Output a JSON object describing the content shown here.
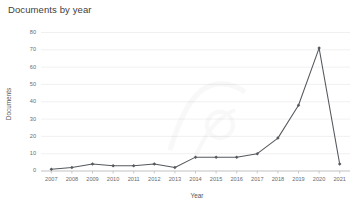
{
  "chart_data": {
    "type": "line",
    "title": "Documents by year",
    "xlabel": "Year",
    "ylabel": "Documents",
    "categories": [
      "2007",
      "2008",
      "2009",
      "2010",
      "2011",
      "2012",
      "2013",
      "2014",
      "2015",
      "2016",
      "2017",
      "2018",
      "2019",
      "2020",
      "2021"
    ],
    "values": [
      1,
      2,
      4,
      3,
      3,
      4,
      2,
      8,
      8,
      8,
      10,
      19,
      38,
      71,
      4
    ],
    "series": [
      {
        "name": "Documents",
        "values": [
          1,
          2,
          4,
          3,
          3,
          4,
          2,
          8,
          8,
          8,
          10,
          19,
          38,
          71,
          4
        ]
      }
    ],
    "ylim": [
      0,
      80
    ],
    "ytick_labels": [
      "0",
      "10",
      "20",
      "30",
      "40",
      "50",
      "60",
      "70",
      "80"
    ],
    "ytick_values": [
      0,
      10,
      20,
      30,
      40,
      50,
      60,
      70,
      80
    ],
    "grid": true,
    "grid_axis": "y",
    "legend": false,
    "legend_position": "none",
    "marker": "diamond",
    "line_color": "#55595e",
    "marker_color": "#55595e",
    "grid_color": "#e9e9e9",
    "axis_color": "#bdbdbd",
    "background_color": "#ffffff",
    "text_color": "#6b6b6b"
  }
}
